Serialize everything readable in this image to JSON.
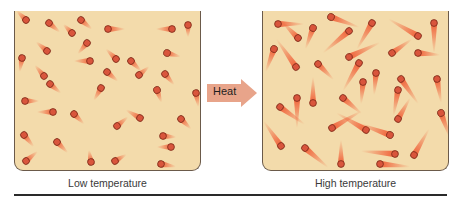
{
  "diagram": {
    "arrow": {
      "label": "Heat",
      "color": "#e8a48a"
    },
    "panels": [
      {
        "id": "low",
        "caption": "Low temperature"
      },
      {
        "id": "high",
        "caption": "High temperature"
      }
    ],
    "colors": {
      "container_fill": "#f3dbab",
      "container_border": "#6b5a4a",
      "particle_fill": "#d9553c",
      "particle_stroke": "#7a2a18",
      "tail_color": "#f05a32",
      "rule": "#2a2a2a"
    }
  },
  "chart_data": {
    "type": "diagram",
    "panels": [
      {
        "caption": "Low temperature",
        "tail_length": "short",
        "particles": [
          [
            11,
            9,
            225,
            13
          ],
          [
            34,
            12,
            40,
            14
          ],
          [
            57,
            22,
            225,
            12
          ],
          [
            66,
            9,
            40,
            14
          ],
          [
            93,
            18,
            0,
            17
          ],
          [
            157,
            18,
            180,
            16
          ],
          [
            173,
            14,
            90,
            12
          ],
          [
            32,
            40,
            220,
            14
          ],
          [
            72,
            32,
            130,
            14
          ],
          [
            75,
            50,
            180,
            16
          ],
          [
            101,
            48,
            225,
            14
          ],
          [
            116,
            50,
            45,
            14
          ],
          [
            152,
            42,
            15,
            14
          ],
          [
            7,
            47,
            100,
            14
          ],
          [
            29,
            65,
            230,
            14
          ],
          [
            92,
            61,
            40,
            14
          ],
          [
            124,
            64,
            320,
            13
          ],
          [
            150,
            63,
            50,
            14
          ],
          [
            35,
            73,
            40,
            14
          ],
          [
            86,
            77,
            120,
            14
          ],
          [
            142,
            79,
            70,
            13
          ],
          [
            181,
            82,
            80,
            14
          ],
          [
            10,
            90,
            0,
            14
          ],
          [
            38,
            101,
            180,
            16
          ],
          [
            59,
            103,
            45,
            14
          ],
          [
            125,
            107,
            210,
            16
          ],
          [
            102,
            115,
            320,
            14
          ],
          [
            166,
            108,
            45,
            14
          ],
          [
            9,
            124,
            50,
            15
          ],
          [
            42,
            131,
            45,
            15
          ],
          [
            148,
            125,
            5,
            13
          ],
          [
            156,
            136,
            180,
            14
          ],
          [
            11,
            150,
            320,
            15
          ],
          [
            76,
            151,
            260,
            12
          ],
          [
            100,
            150,
            330,
            13
          ],
          [
            146,
            153,
            10,
            15
          ]
        ]
      },
      {
        "caption": "High temperature",
        "tail_length": "long",
        "particles": [
          [
            15,
            13,
            0,
            26
          ],
          [
            68,
            6,
            20,
            30
          ],
          [
            109,
            12,
            120,
            30
          ],
          [
            171,
            12,
            90,
            30
          ],
          [
            35,
            27,
            225,
            22
          ],
          [
            50,
            17,
            110,
            22
          ],
          [
            86,
            20,
            140,
            34
          ],
          [
            155,
            25,
            210,
            34
          ],
          [
            11,
            38,
            110,
            24
          ],
          [
            33,
            56,
            235,
            34
          ],
          [
            86,
            46,
            335,
            34
          ],
          [
            55,
            53,
            45,
            22
          ],
          [
            129,
            42,
            325,
            24
          ],
          [
            155,
            42,
            5,
            22
          ],
          [
            96,
            52,
            120,
            32
          ],
          [
            113,
            62,
            95,
            22
          ],
          [
            135,
            79,
            100,
            26
          ],
          [
            100,
            71,
            95,
            22
          ],
          [
            138,
            68,
            55,
            30
          ],
          [
            174,
            68,
            80,
            24
          ],
          [
            34,
            87,
            90,
            30
          ],
          [
            50,
            92,
            270,
            26
          ],
          [
            80,
            87,
            40,
            24
          ],
          [
            17,
            96,
            35,
            30
          ],
          [
            135,
            108,
            300,
            24
          ],
          [
            178,
            102,
            70,
            26
          ],
          [
            69,
            117,
            330,
            34
          ],
          [
            103,
            119,
            210,
            34
          ],
          [
            18,
            135,
            235,
            30
          ],
          [
            42,
            137,
            40,
            30
          ],
          [
            127,
            124,
            200,
            34
          ],
          [
            132,
            143,
            185,
            34
          ],
          [
            151,
            144,
            300,
            30
          ],
          [
            78,
            153,
            270,
            24
          ],
          [
            117,
            153,
            5,
            30
          ]
        ]
      }
    ]
  }
}
